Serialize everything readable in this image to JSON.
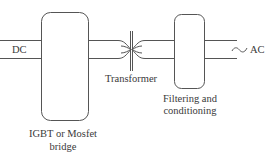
{
  "diagram": {
    "type": "block-diagram",
    "title": "",
    "colors": {
      "stroke": "#555555",
      "text": "#3a3a3a",
      "background": "#ffffff"
    },
    "input": {
      "label": "DC"
    },
    "blocks": [
      {
        "id": "bridge",
        "label_line1": "IGBT or Mosfet",
        "label_line2": "bridge"
      },
      {
        "id": "transformer",
        "label": "Transformer"
      },
      {
        "id": "filter",
        "label_line1": "Filtering and",
        "label_line2": "conditioning"
      }
    ],
    "output": {
      "label": "AC",
      "symbol": "sine-wave-icon"
    },
    "edges": [
      {
        "from": "DC",
        "to": "bridge"
      },
      {
        "from": "bridge",
        "to": "transformer"
      },
      {
        "from": "transformer",
        "to": "filter"
      },
      {
        "from": "filter",
        "to": "AC"
      }
    ]
  }
}
